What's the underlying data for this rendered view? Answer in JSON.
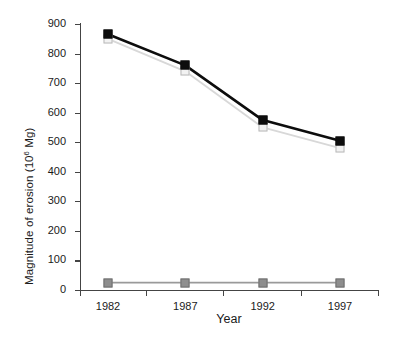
{
  "chart_data": {
    "type": "line",
    "title": "",
    "xlabel": "Year",
    "ylabel": "Magnitude of erosion (10^6 Mg)",
    "ylabel_prefix": "Magnitude of erosion (10",
    "ylabel_exponent": "6",
    "ylabel_suffix": " Mg)",
    "categories": [
      "1982",
      "1987",
      "1992",
      "1997"
    ],
    "x": [
      1982,
      1987,
      1992,
      1997
    ],
    "ylim": [
      0,
      900
    ],
    "xlim": [
      1980,
      1999
    ],
    "ytick_labels": [
      "0",
      "100",
      "200",
      "300",
      "400",
      "500",
      "600",
      "700",
      "800",
      "900"
    ],
    "ytick_values": [
      0,
      100,
      200,
      300,
      400,
      500,
      600,
      700,
      800,
      900
    ],
    "ytick_interval": 100,
    "grid": false,
    "legend": "none",
    "series": [
      {
        "name": "series-black-filled-squares",
        "marker": "filled-square",
        "color": "#0d0d0d",
        "line_color": "#0d0d0d",
        "line_width": 2.6,
        "values": [
          865,
          760,
          575,
          505
        ]
      },
      {
        "name": "series-open-light-squares",
        "marker": "open-square",
        "color": "#f2f2f2",
        "line_color": "#d8d8d8",
        "line_width": 1.8,
        "values": [
          850,
          740,
          550,
          480
        ]
      },
      {
        "name": "series-gray-filled-squares",
        "marker": "filled-square",
        "color": "#8e8e8e",
        "line_color": "#9a9a9a",
        "line_width": 1.8,
        "values": [
          25,
          25,
          25,
          25
        ]
      }
    ]
  },
  "axes": {
    "x_title": "Year",
    "y_title_parts": {
      "prefix": "Magnitude of erosion (10",
      "exponent": "6",
      "suffix": " Mg)"
    }
  }
}
